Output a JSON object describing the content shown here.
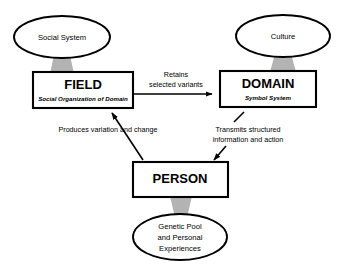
{
  "diagram": {
    "background_color": "#ffffff",
    "line_color": "#000000",
    "connector_color": "#b3b3b3",
    "nodes": {
      "social_system": {
        "label": "Social System",
        "shape": "ellipse"
      },
      "culture": {
        "label": "Culture",
        "shape": "ellipse"
      },
      "field": {
        "label": "FIELD",
        "sublabel": "Social Organization of Domain",
        "shape": "box"
      },
      "domain": {
        "label": "DOMAIN",
        "sublabel": "Symbol System",
        "shape": "box"
      },
      "person": {
        "label": "PERSON",
        "shape": "box"
      },
      "genetic_pool": {
        "label_line1": "Genetic Pool",
        "label_line2": "and Personal",
        "label_line3": "Experiences",
        "shape": "ellipse"
      }
    },
    "edges": {
      "field_to_domain": {
        "label_line1": "Retains",
        "label_line2": "selected variants",
        "from": "FIELD",
        "to": "DOMAIN"
      },
      "person_to_field": {
        "label_line1": "Produces variation and change",
        "from": "PERSON",
        "to": "FIELD"
      },
      "domain_to_person": {
        "label_line1": "Transmits structured",
        "label_line2": "information and action",
        "from": "DOMAIN",
        "to": "PERSON"
      }
    }
  }
}
